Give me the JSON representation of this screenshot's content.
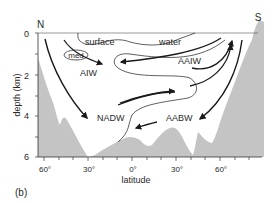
{
  "figure": {
    "panel_label": "(b)",
    "north_label": "N",
    "south_label": "S",
    "y_axis": {
      "label": "depth (km)",
      "ticks": [
        "0",
        "2",
        "4",
        "6"
      ]
    },
    "x_axis": {
      "label": "latitude",
      "ticks": [
        "60°",
        "30°",
        "0°",
        "30°",
        "60°"
      ]
    },
    "water_masses": {
      "surface": "surface",
      "water": "water",
      "med": "med",
      "aiw": "AIW",
      "aaiw": "AAIW",
      "nadw": "NADW",
      "aabw": "AABW"
    },
    "colors": {
      "seafloor": "#c4c4c4",
      "lines": "#1a1a1a",
      "text": "#2a2a2a"
    }
  }
}
